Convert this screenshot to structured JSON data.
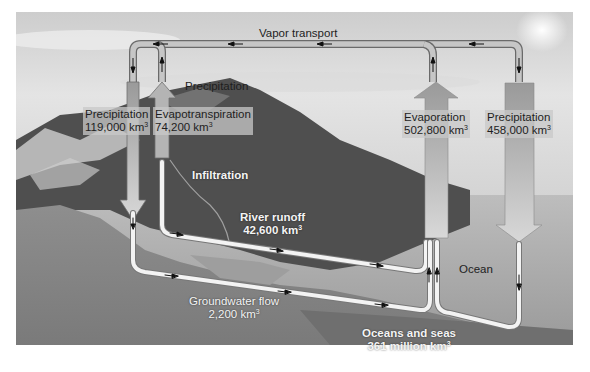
{
  "diagram": {
    "colors": {
      "sky_top": "#cfcfcf",
      "sky_bottom": "#e6e6e6",
      "mountains_dark": "#4a4a4a",
      "land_gray": "#8a8a8a",
      "ocean": "#a9a9a9",
      "deep_ocean": "#777777",
      "pipe_fill": "#c8c8c8",
      "pipe_edge": "#6a6a6a",
      "ground_pipe": "#f2f2f2",
      "column_fill": "#a8a8a8",
      "arrow_fill": "#bcbcbc"
    },
    "labels": {
      "vapor_transport": "Vapor transport",
      "precip_land_top": "Precipitation",
      "precip_land_name": "Precipitation",
      "precip_land_value": "119,000 km",
      "evapotranspiration_name": "Evapotranspiration",
      "evapotranspiration_value": "74,200 km",
      "evaporation_name": "Evaporation",
      "evaporation_value": "502,800 km",
      "precip_ocean_name": "Precipitation",
      "precip_ocean_value": "458,000 km",
      "infiltration": "Infiltration",
      "river_runoff_name": "River runoff",
      "river_runoff_value": "42,600 km",
      "groundwater_name": "Groundwater flow",
      "groundwater_value": "2,200 km",
      "ocean": "Ocean",
      "oceans_seas_name": "Oceans and seas",
      "oceans_seas_value": "361 million km",
      "cube_exponent": "3"
    },
    "flows": [
      {
        "name": "Precipitation (land)",
        "value_km3": 119000,
        "direction": "down"
      },
      {
        "name": "Evapotranspiration",
        "value_km3": 74200,
        "direction": "up"
      },
      {
        "name": "Evaporation (ocean)",
        "value_km3": 502800,
        "direction": "up"
      },
      {
        "name": "Precipitation (ocean)",
        "value_km3": 458000,
        "direction": "down"
      },
      {
        "name": "River runoff",
        "value_km3": 42600,
        "direction": "to ocean"
      },
      {
        "name": "Groundwater flow",
        "value_km3": 2200,
        "direction": "to ocean"
      },
      {
        "name": "Vapor transport",
        "direction": "ocean to land"
      }
    ],
    "reservoirs": [
      {
        "name": "Oceans and seas",
        "value": "361 million km3"
      }
    ]
  }
}
